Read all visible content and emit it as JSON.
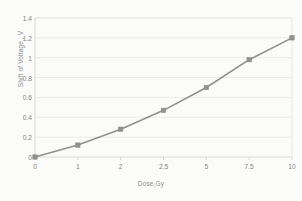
{
  "chart_data": {
    "type": "line",
    "title": "",
    "xlabel": "Dose,Gy",
    "ylabel": "Shift of Voltage , V",
    "categories": [
      "0",
      "1",
      "2",
      "2.5",
      "5",
      "7.5",
      "10"
    ],
    "values": [
      0.0,
      0.12,
      0.28,
      0.47,
      0.7,
      0.98,
      1.2
    ],
    "ylim": [
      0,
      1.4
    ],
    "ytick_labels": [
      "0",
      "0.2",
      "0.4",
      "0.6",
      "0.8",
      "1",
      "1.2",
      "1.4"
    ],
    "ytick_values": [
      0,
      0.2,
      0.4,
      0.6,
      0.8,
      1,
      1.2,
      1.4
    ],
    "xtick_labels": [
      "0",
      "1",
      "2",
      "2.5",
      "5",
      "7.5",
      "10"
    ],
    "grid": "horizontal",
    "legend": "none",
    "series_color": "#595959",
    "marker": "square",
    "gridline_color": "#e4e4e4",
    "axis_color": "#c9c9c9",
    "background": "#fdfdfd"
  }
}
